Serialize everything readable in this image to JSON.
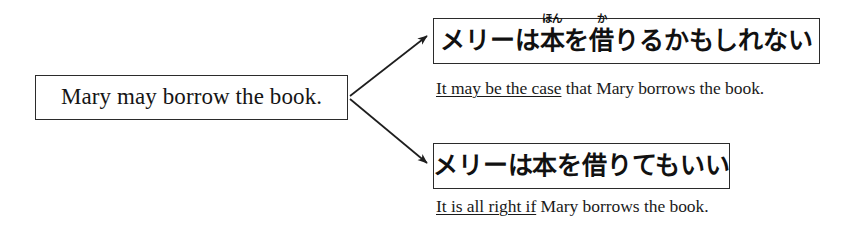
{
  "diagram": {
    "type": "branching-derivation-diagram",
    "source_node": {
      "text": "Mary may borrow the book."
    },
    "branches": [
      {
        "id": "epistemic",
        "japanese": {
          "segments": [
            {
              "base": "メリーは",
              "ruby": ""
            },
            {
              "base": "本",
              "ruby": "ほん"
            },
            {
              "base": "を",
              "ruby": ""
            },
            {
              "base": "借",
              "ruby": "か"
            },
            {
              "base": "りるかもしれない",
              "ruby": ""
            }
          ],
          "plain": "メリーは本を借りるかもしれない"
        },
        "gloss": {
          "underlined": "It may be the case",
          "rest": " that Mary borrows the book."
        },
        "arrow": "arrow-up-right"
      },
      {
        "id": "deontic",
        "japanese": {
          "segments": [
            {
              "base": "メリーは本を借りてもいい",
              "ruby": ""
            }
          ],
          "plain": "メリーは本を借りてもいい"
        },
        "gloss": {
          "underlined": "It is all right if",
          "rest": " Mary borrows the book."
        },
        "arrow": "arrow-down-right"
      }
    ],
    "colors": {
      "ink": "#151515",
      "border": "#2b2b2b",
      "background": "#ffffff"
    }
  }
}
